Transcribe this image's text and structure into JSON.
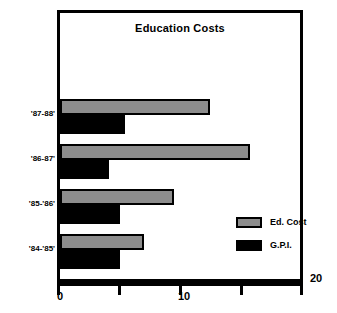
{
  "chart_data": {
    "type": "bar",
    "orientation": "horizontal",
    "title": "Education Costs",
    "xlabel": "",
    "ylabel": "",
    "xlim": [
      0,
      20
    ],
    "grid": false,
    "legend_position": "inside-right",
    "categories": [
      "'87-88'",
      "'86-87'",
      "'85-'86'",
      "'84-'85'"
    ],
    "x_ticks": [
      0,
      5,
      10,
      15,
      20
    ],
    "x_tick_labels": [
      "0",
      "",
      "10",
      "",
      "20"
    ],
    "series": [
      {
        "name": "Ed. Cost",
        "color": "#8d8d8d",
        "values": [
          12.5,
          15.8,
          9.5,
          7.0
        ]
      },
      {
        "name": "G.P.I.",
        "color": "#000000",
        "values": [
          5.4,
          4.1,
          5.0,
          5.0
        ]
      }
    ]
  },
  "legend": {
    "items": [
      {
        "label": "Ed. Cost",
        "swatch": "ed-cost-swatch"
      },
      {
        "label": "G.P.I.",
        "swatch": "gpi-swatch"
      }
    ]
  },
  "axis": {
    "tick_label_0": "0",
    "tick_label_10": "10",
    "tick_label_20": "20"
  },
  "categories_labels": {
    "c0": "'87-88'",
    "c1": "'86-87'",
    "c2": "'85-'86'",
    "c3": "'84-'85'"
  }
}
